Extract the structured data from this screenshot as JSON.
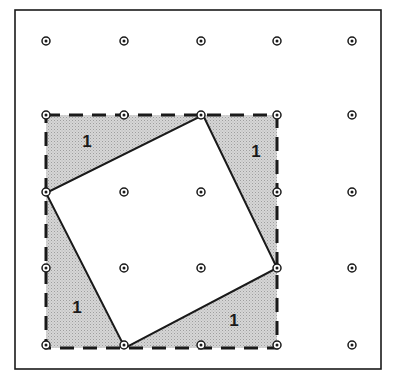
{
  "figure": {
    "canvas": {
      "width": 397,
      "height": 382,
      "background": "#ffffff"
    },
    "frame": {
      "name": "outer-border",
      "x": 15,
      "y": 10,
      "width": 366,
      "height": 359,
      "stroke": "#1a1a1a",
      "stroke_width": 1.6,
      "fill": "#ffffff"
    },
    "lattice": {
      "label": "dot grid",
      "columns": 5,
      "rows": 5,
      "x_positions": [
        46,
        124,
        201,
        277,
        352
      ],
      "y_positions": [
        41,
        115,
        192,
        268,
        345
      ],
      "dot_radius_outer": 4.0,
      "dot_radius_inner": 1.5,
      "dot_stroke": "#1a1a1a",
      "dot_fill": "#ffffff",
      "dot_core": "#1a1a1a"
    },
    "shaded_square": {
      "label": "dashed unit square (shaded)",
      "x": 46,
      "y": 115,
      "width": 231,
      "height": 233,
      "fill": "#c9c9c9",
      "stroke": "#1a1a1a",
      "stroke_width": 3,
      "dash_pattern": "14 9"
    },
    "tilted_square": {
      "label": "inscribed tilted square",
      "fill": "#ffffff",
      "stroke": "#1a1a1a",
      "stroke_width": 2,
      "vertices": [
        {
          "name": "top",
          "x": 203,
          "y": 115
        },
        {
          "name": "right",
          "x": 277,
          "y": 268
        },
        {
          "name": "bottom",
          "x": 125,
          "y": 348
        },
        {
          "name": "left",
          "x": 46,
          "y": 193
        }
      ]
    },
    "area_labels": [
      {
        "name": "area-label-top-left",
        "text": "1",
        "x": 87,
        "y": 143
      },
      {
        "name": "area-label-top-right",
        "text": "1",
        "x": 256,
        "y": 153
      },
      {
        "name": "area-label-bottom-left",
        "text": "1",
        "x": 77,
        "y": 309
      },
      {
        "name": "area-label-bottom-right",
        "text": "1",
        "x": 234,
        "y": 322
      }
    ]
  }
}
